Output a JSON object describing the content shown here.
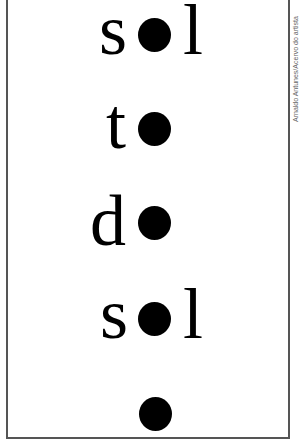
{
  "poem": {
    "lines": [
      {
        "before": "s",
        "after": "l"
      },
      {
        "before": "t",
        "after": ""
      },
      {
        "before": "d",
        "after": ""
      },
      {
        "before": "s",
        "after": "l"
      },
      {
        "before": "",
        "after": ""
      }
    ],
    "dot_symbol": "filled-circle",
    "ink_color": "#000000",
    "frame_color": "#555555"
  },
  "credit": "Arnaldo Antunes/Acervo do artista"
}
